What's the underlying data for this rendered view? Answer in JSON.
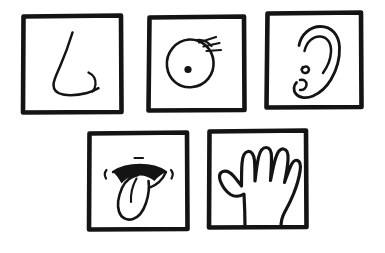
{
  "illustration": {
    "title": "The Five Senses",
    "style": "hand-drawn black ink line art on white",
    "background_color": "#ffffff",
    "ink_color": "#141414",
    "panel_count": 5,
    "rows": [
      {
        "row_index": 1,
        "panel_count": 3
      },
      {
        "row_index": 2,
        "panel_count": 2
      }
    ]
  },
  "panels": [
    {
      "id": "nose",
      "sense": "Smell",
      "subject_label": "Nose",
      "icon_name": "nose-icon",
      "row": 1,
      "position": 1,
      "frame": {
        "x": 22,
        "y": 15,
        "width": 100,
        "height": 98
      },
      "description": "Side profile of a nose: bridge line curving down to a rounded tip with a small separate nostril hook to the right"
    },
    {
      "id": "eye",
      "sense": "Sight",
      "subject_label": "Eye",
      "icon_name": "eye-icon",
      "row": 1,
      "position": 2,
      "frame": {
        "x": 148,
        "y": 16,
        "width": 97,
        "height": 95
      },
      "description": "Round eye with a solid dark pupil and three eyelashes radiating from the upper right",
      "eyelash_count": 3
    },
    {
      "id": "ear",
      "sense": "Hearing",
      "subject_label": "Ear",
      "icon_name": "ear-icon",
      "row": 1,
      "position": 3,
      "frame": {
        "x": 266,
        "y": 12,
        "width": 96,
        "height": 96
      },
      "description": "Outer ear with helix outline, inner antihelix curve, and a squiggly tragus detail"
    },
    {
      "id": "mouth",
      "sense": "Taste",
      "subject_label": "Mouth and tongue",
      "icon_name": "tongue-icon",
      "row": 2,
      "position": 1,
      "frame": {
        "x": 88,
        "y": 132,
        "width": 100,
        "height": 98
      },
      "description": "Open mouth with a dark filled upper lip and a long tongue sticking out downward, small tick marks at both mouth corners"
    },
    {
      "id": "hand",
      "sense": "Touch",
      "subject_label": "Hand",
      "icon_name": "hand-icon",
      "row": 2,
      "position": 2,
      "frame": {
        "x": 208,
        "y": 130,
        "width": 99,
        "height": 98
      },
      "description": "Open hand outline with four fingers and a thumb on the left, wrist extending to the bottom edge",
      "finger_count": 5
    }
  ]
}
